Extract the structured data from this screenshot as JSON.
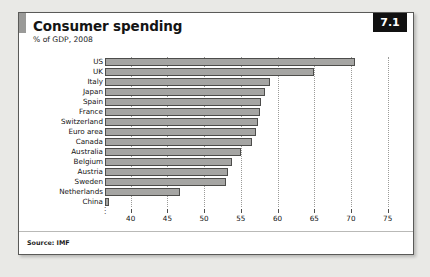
{
  "card": {
    "title": "Consumer spending",
    "subtitle": "% of GDP, 2008",
    "badge": "7.1",
    "source": "Source: IMF"
  },
  "colors": {
    "page_background": "#e9e9e6",
    "card_background": "#ffffff",
    "card_border": "#5a5a58",
    "title_accent": "#9a9a98",
    "badge_background": "#111111",
    "badge_text": "#ffffff",
    "bar_fill": "#a5a5a3",
    "bar_stroke": "#4d4d4b",
    "gridline": "#9b9b99"
  },
  "chart_data": {
    "type": "bar",
    "orientation": "horizontal",
    "title": "Consumer spending",
    "subtitle": "% of GDP, 2008",
    "xlabel": "",
    "ylabel": "",
    "xlim": [
      36.5,
      76
    ],
    "axis_break": true,
    "axis_break_symbol": "⸺",
    "grid": "vertical-dotted",
    "legend": "none",
    "ticks": [
      40,
      45,
      50,
      55,
      60,
      65,
      70,
      75
    ],
    "tick_labels": [
      "40",
      "45",
      "50",
      "55",
      "60",
      "65",
      "70",
      "75"
    ],
    "categories": [
      "US",
      "UK",
      "Italy",
      "Japan",
      "Spain",
      "France",
      "Switzerland",
      "Euro area",
      "Canada",
      "Australia",
      "Belgium",
      "Austria",
      "Sweden",
      "Netherlands",
      "China"
    ],
    "values": [
      70.5,
      65.0,
      59.0,
      58.3,
      57.8,
      57.6,
      57.3,
      57.1,
      56.5,
      55.0,
      53.8,
      53.2,
      53.0,
      46.7,
      37.0
    ],
    "source": "Source: IMF"
  }
}
